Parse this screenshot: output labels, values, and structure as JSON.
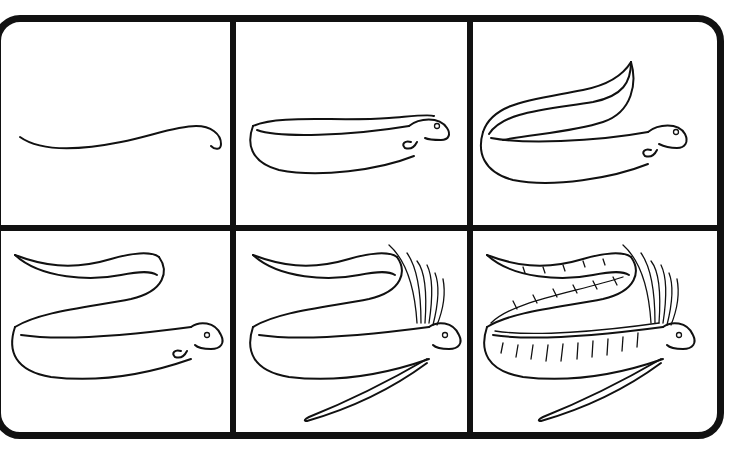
{
  "tutorial": {
    "subject": "oarfish",
    "steps": [
      {
        "step": 1,
        "description": "body curve line with head hook"
      },
      {
        "step": 2,
        "description": "add body outline, head, eye, mouth and fin"
      },
      {
        "step": 3,
        "description": "add looping upper tail section"
      },
      {
        "step": 4,
        "description": "extend the tail with a wavy end"
      },
      {
        "step": 5,
        "description": "add dorsal crest rays and long pelvic fins"
      },
      {
        "step": 6,
        "description": "add stripe and scale details"
      }
    ]
  },
  "colors": {
    "line": "#111111",
    "background": "#ffffff"
  }
}
